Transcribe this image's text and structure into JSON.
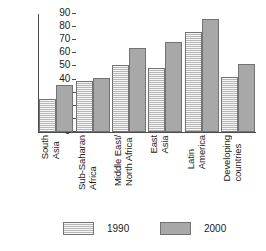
{
  "chart_data": {
    "type": "bar",
    "title": "",
    "subtitle": "",
    "xlabel": "",
    "ylabel": "",
    "ylim": [
      0,
      90
    ],
    "ytick_step": 10,
    "yticks": [
      0,
      10,
      20,
      30,
      40,
      50,
      60,
      70,
      80,
      90
    ],
    "grid": false,
    "legend_position": "bottom",
    "categories": [
      "South Asia",
      "Sub-Saharan Africa",
      "Middle East/ North Africa",
      "East Asia",
      "Latin America",
      "Developing countries"
    ],
    "category_lines": [
      [
        "South",
        "Asia"
      ],
      [
        "Sub-Saharan",
        "Africa"
      ],
      [
        "Middle East/",
        "North Africa"
      ],
      [
        "East",
        "Asia"
      ],
      [
        "Latin",
        "America"
      ],
      [
        "Developing",
        "countries"
      ]
    ],
    "series": [
      {
        "name": "1990",
        "color": "#c8c8c8",
        "pattern": "horizontal-hatch",
        "values": [
          25,
          39,
          51,
          49,
          76,
          42
        ]
      },
      {
        "name": "2000",
        "color": "#a8a8a8",
        "pattern": "solid",
        "values": [
          36,
          41,
          64,
          69,
          86,
          52
        ]
      }
    ]
  },
  "legend": {
    "items": [
      {
        "label": "1990"
      },
      {
        "label": "2000"
      }
    ]
  }
}
